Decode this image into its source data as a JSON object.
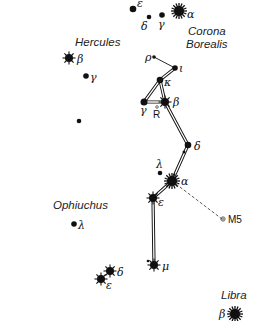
{
  "constellations": {
    "hercules": "Hercules",
    "corona_borealis_1": "Corona",
    "corona_borealis_2": "Borealis",
    "ophiuchus": "Ophiuchus",
    "libra": "Libra"
  },
  "stars": {
    "crb_epsilon": "ε",
    "crb_delta": "δ",
    "crb_gamma": "γ",
    "crb_alpha": "α",
    "her_beta": "β",
    "her_gamma": "γ",
    "ser_rho": "ρ",
    "ser_iota": "ι",
    "ser_kappa": "κ",
    "ser_gamma": "γ",
    "ser_beta": "β",
    "ser_R": "R",
    "ser_delta": "δ",
    "ser_lambda": "λ",
    "ser_alpha": "α",
    "ser_epsilon": "ε",
    "ser_mu": "μ",
    "oph_lambda": "λ",
    "oph_delta": "δ",
    "oph_epsilon": "ε",
    "lib_beta": "β"
  },
  "objects": {
    "m5": "M5"
  },
  "colors": {
    "ink": "#111111",
    "background": "#ffffff"
  }
}
